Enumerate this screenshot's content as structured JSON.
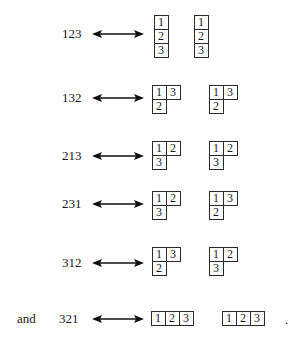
{
  "figure": {
    "prefix_word": "and",
    "trailing_punctuation": ".",
    "rows": [
      {
        "permutation": "123",
        "P": [
          [
            "1"
          ],
          [
            "2"
          ],
          [
            "3"
          ]
        ],
        "Q": [
          [
            "1"
          ],
          [
            "2"
          ],
          [
            "3"
          ]
        ]
      },
      {
        "permutation": "132",
        "P": [
          [
            "1",
            "3"
          ],
          [
            "2"
          ]
        ],
        "Q": [
          [
            "1",
            "3"
          ],
          [
            "2"
          ]
        ]
      },
      {
        "permutation": "213",
        "P": [
          [
            "1",
            "2"
          ],
          [
            "3"
          ]
        ],
        "Q": [
          [
            "1",
            "2"
          ],
          [
            "3"
          ]
        ]
      },
      {
        "permutation": "231",
        "P": [
          [
            "1",
            "2"
          ],
          [
            "3"
          ]
        ],
        "Q": [
          [
            "1",
            "3"
          ],
          [
            "2"
          ]
        ]
      },
      {
        "permutation": "312",
        "P": [
          [
            "1",
            "3"
          ],
          [
            "2"
          ]
        ],
        "Q": [
          [
            "1",
            "2"
          ],
          [
            "3"
          ]
        ]
      },
      {
        "permutation": "321",
        "P": [
          [
            "1",
            "2",
            "3"
          ]
        ],
        "Q": [
          [
            "1",
            "2",
            "3"
          ]
        ]
      }
    ],
    "arrow_icon": "double-headed-arrow"
  }
}
